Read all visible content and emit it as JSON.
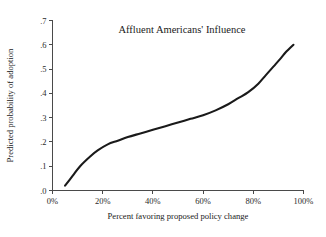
{
  "chart_data": {
    "type": "line",
    "title": "Affluent Americans' Influence",
    "xlabel": "Percent favoring proposed policy change",
    "ylabel": "Predicted probability of adoption",
    "xlim": [
      0,
      100
    ],
    "ylim": [
      0,
      0.7
    ],
    "grid": false,
    "legend": "none",
    "xticks": [
      0,
      20,
      40,
      60,
      80,
      100
    ],
    "xtick_labels": [
      "0%",
      "20%",
      "40%",
      "60%",
      "80%",
      "100%"
    ],
    "yticks": [
      0,
      0.1,
      0.2,
      0.3,
      0.4,
      0.5,
      0.6,
      0.7
    ],
    "ytick_labels": [
      ".0",
      ".1",
      ".2",
      ".3",
      ".4",
      ".5",
      ".6",
      ".7"
    ],
    "series": [
      {
        "name": "Predicted probability of adoption",
        "color": "#1a1a1a",
        "x": [
          5,
          8,
          11,
          15,
          18,
          22,
          26,
          30,
          35,
          40,
          45,
          50,
          55,
          60,
          65,
          70,
          74,
          78,
          82,
          85,
          88,
          91,
          93,
          96
        ],
        "values": [
          0.02,
          0.06,
          0.1,
          0.14,
          0.165,
          0.19,
          0.205,
          0.22,
          0.235,
          0.25,
          0.265,
          0.28,
          0.295,
          0.31,
          0.33,
          0.355,
          0.38,
          0.405,
          0.44,
          0.475,
          0.51,
          0.545,
          0.57,
          0.6
        ]
      }
    ]
  }
}
